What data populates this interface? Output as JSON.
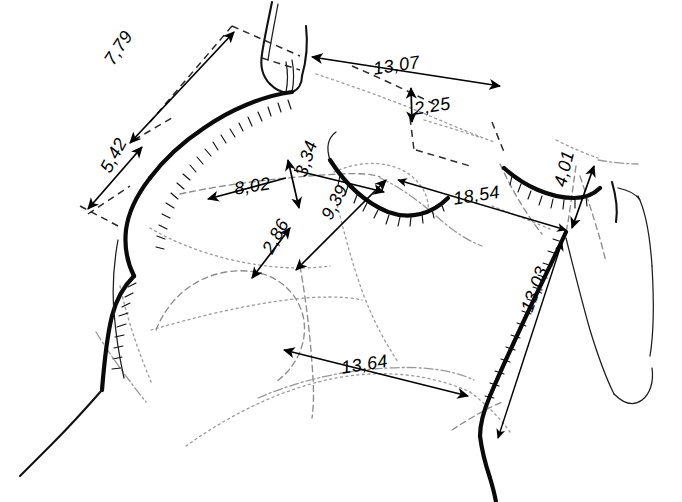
{
  "figure": {
    "background_color": "#ffffff",
    "ink_color": "#000000",
    "construction_color": "#9a9a9a",
    "units_note": "decimal comma"
  },
  "dimensions": [
    {
      "id": "dim-7-79",
      "label": "7,79",
      "x": 101,
      "y": 58,
      "rotation": -57,
      "font_size": 18
    },
    {
      "id": "dim-5-42",
      "label": "5,42",
      "x": 97,
      "y": 167,
      "rotation": -62,
      "font_size": 18
    },
    {
      "id": "dim-13-07",
      "label": "13,07",
      "x": 372,
      "y": 60,
      "rotation": -9,
      "font_size": 18
    },
    {
      "id": "dim-2-25",
      "label": "2,25",
      "x": 413,
      "y": 100,
      "rotation": -9,
      "font_size": 18
    },
    {
      "id": "dim-8-02",
      "label": "8,02",
      "x": 233,
      "y": 180,
      "rotation": -9,
      "font_size": 18
    },
    {
      "id": "dim-3-34",
      "label": "3,34",
      "x": 292,
      "y": 173,
      "rotation": -72,
      "font_size": 18
    },
    {
      "id": "dim-9-39",
      "label": "9,39",
      "x": 318,
      "y": 214,
      "rotation": -62,
      "font_size": 18
    },
    {
      "id": "dim-2-86",
      "label": "2,86",
      "x": 259,
      "y": 248,
      "rotation": -62,
      "font_size": 18
    },
    {
      "id": "dim-18-54",
      "label": "18,54",
      "x": 452,
      "y": 190,
      "rotation": -9,
      "font_size": 18
    },
    {
      "id": "dim-4-01",
      "label": "4,01",
      "x": 551,
      "y": 184,
      "rotation": -76,
      "font_size": 18
    },
    {
      "id": "dim-13-03",
      "label": "13,03",
      "x": 518,
      "y": 308,
      "rotation": -70,
      "font_size": 18
    },
    {
      "id": "dim-13-64",
      "label": "13,64",
      "x": 340,
      "y": 359,
      "rotation": -9,
      "font_size": 18
    }
  ]
}
